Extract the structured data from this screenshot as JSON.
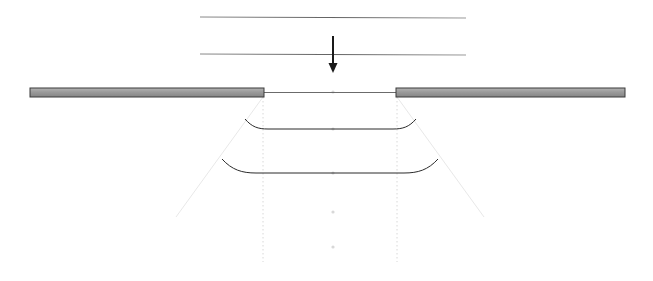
{
  "figure": {
    "width": 653,
    "height": 281,
    "background_color": "#ffffff"
  },
  "colors": {
    "plate_fill_light": "#aaaaaa",
    "plate_fill_dark": "#8c8c8c",
    "plate_stroke": "#3a3a3a",
    "rule_line": "#6f6f6f",
    "arrow": "#1a1a1a",
    "contour": "#2b2b2b",
    "thin_link": "#5a5a5a",
    "guide_faint": "#e8e8e8",
    "guide_dot": "#d8d8d8"
  },
  "elements": {
    "upper_rule_top": {
      "name": "upper horizontal reference line",
      "x1": 200,
      "y1": 17,
      "x2": 466,
      "y2": 18,
      "stroke_width": 1.1
    },
    "upper_rule_bottom": {
      "name": "lower horizontal reference line",
      "x1": 200,
      "y1": 54,
      "x2": 466,
      "y2": 55,
      "stroke_width": 1.1
    },
    "load_arrow": {
      "name": "downward load arrow",
      "x": 333,
      "y_start": 36,
      "y_end": 73,
      "shaft_width": 2.0,
      "head_width": 9,
      "head_height": 10,
      "direction": "down"
    },
    "left_plate": {
      "name": "left bearing plate",
      "x": 30,
      "y": 88,
      "width": 234,
      "height": 9
    },
    "right_plate": {
      "name": "right bearing plate",
      "x": 396,
      "y": 88,
      "width": 229,
      "height": 9
    },
    "gap_link": {
      "name": "thin line spanning gap between plates",
      "x1": 264,
      "y1": 92.5,
      "x2": 396,
      "y2": 92.5,
      "stroke_width": 0.9
    },
    "contour_upper": {
      "name": "upper stress contour",
      "path": "M 245,119 C 252,127 258,129 268,129 L 393,129 C 403,129 409,127 416,119",
      "stroke_width": 1.0
    },
    "contour_lower": {
      "name": "lower stress contour",
      "path": "M 222,159 C 232,170 242,173 256,173 L 404,173 C 418,173 428,170 438,159",
      "stroke_width": 1.0
    },
    "guide_diagonal_left": {
      "name": "left dispersion guide line",
      "x1": 263,
      "y1": 97,
      "x2": 176,
      "y2": 217
    },
    "guide_diagonal_right": {
      "name": "right dispersion guide line",
      "x1": 397,
      "y1": 97,
      "x2": 484,
      "y2": 217
    },
    "guide_vertical_left": {
      "name": "left plate edge vertical guide",
      "x": 263,
      "y1": 97,
      "y2": 262
    },
    "guide_vertical_right": {
      "name": "right plate edge vertical guide",
      "x": 397,
      "y1": 97,
      "y2": 262
    },
    "axis_dots": {
      "name": "centerline marker dots",
      "x": 333,
      "y_values": [
        92,
        129,
        173,
        212,
        247
      ],
      "radius": 1.6
    }
  }
}
